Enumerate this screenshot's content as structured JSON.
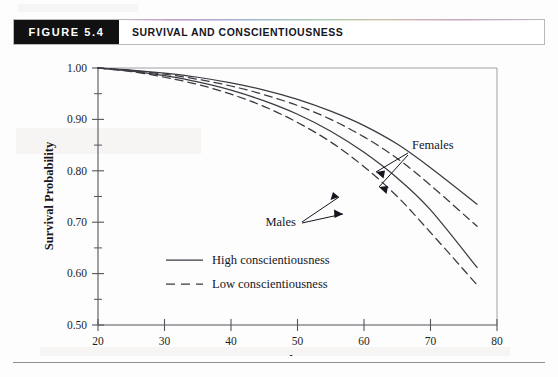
{
  "figure": {
    "tag": "FIGURE  5.4",
    "title": "SURVIVAL AND CONSCIENTIOUSNESS"
  },
  "chart_data": {
    "type": "line",
    "title": "Survival and Conscientiousness",
    "xlabel": "Age",
    "ylabel": "Survival Probability",
    "xlim": [
      20,
      80
    ],
    "ylim": [
      0.5,
      1.0
    ],
    "xticks": [
      20,
      30,
      40,
      50,
      60,
      70,
      80
    ],
    "yticks": [
      "0.50",
      "0.60",
      "0.70",
      "0.80",
      "0.90",
      "1.00"
    ],
    "yticks_minor": [
      0.55,
      0.65,
      0.75,
      0.85,
      0.95
    ],
    "grid": false,
    "legend_position": "lower-left-inside",
    "x": [
      20,
      25,
      30,
      35,
      40,
      45,
      50,
      55,
      60,
      65,
      70,
      77
    ],
    "series": [
      {
        "name": "Females, high conscientiousness",
        "style": "solid",
        "group": "Females",
        "values": [
          1.0,
          0.996,
          0.99,
          0.982,
          0.971,
          0.957,
          0.939,
          0.916,
          0.888,
          0.852,
          0.806,
          0.735
        ]
      },
      {
        "name": "Females, low conscientiousness",
        "style": "dashed",
        "group": "Females",
        "values": [
          1.0,
          0.995,
          0.988,
          0.978,
          0.965,
          0.948,
          0.927,
          0.9,
          0.866,
          0.824,
          0.772,
          0.692
        ]
      },
      {
        "name": "Males, high conscientiousness",
        "style": "solid",
        "group": "Males",
        "values": [
          1.0,
          0.994,
          0.985,
          0.973,
          0.957,
          0.936,
          0.91,
          0.877,
          0.836,
          0.786,
          0.724,
          0.612
        ]
      },
      {
        "name": "Males, low conscientiousness",
        "style": "dashed",
        "group": "Males",
        "values": [
          1.0,
          0.993,
          0.982,
          0.968,
          0.949,
          0.925,
          0.894,
          0.856,
          0.808,
          0.75,
          0.68,
          0.578
        ]
      }
    ],
    "annotations": [
      {
        "text": "Females",
        "x": 66,
        "y": 0.925,
        "arrows": 2
      },
      {
        "text": "Males",
        "x": 53,
        "y": 0.792,
        "arrows": 2
      }
    ],
    "legend": [
      {
        "label": "High conscientiousness",
        "style": "solid"
      },
      {
        "label": "Low conscientiousness",
        "style": "dashed"
      }
    ]
  },
  "colors": {
    "tag_background": "#111111",
    "tag_text": "#ffffff",
    "title_text": "#16161e",
    "axis": "#55555c",
    "curve": "#3a3a42",
    "page_background": "#fdfdfd"
  }
}
